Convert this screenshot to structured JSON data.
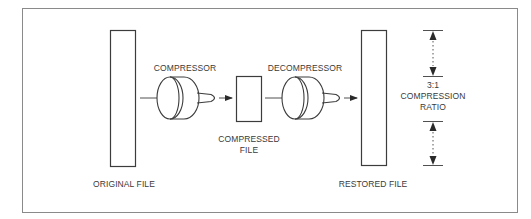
{
  "diagram": {
    "colors": {
      "stroke": "#3c3c3c",
      "frame": "#8a8a8a",
      "text": "#3a3a3a",
      "background": "#ffffff"
    },
    "nodes": {
      "original_file": {
        "label": "ORIGINAL FILE"
      },
      "compressor": {
        "label": "COMPRESSOR"
      },
      "compressed_file": {
        "label": "COMPRESSED\nFILE"
      },
      "decompressor": {
        "label": "DECOMPRESSOR"
      },
      "restored_file": {
        "label": "RESTORED FILE"
      }
    },
    "ratio": {
      "value": "3:1",
      "label": "COMPRESSION\nRATIO"
    },
    "flow": [
      {
        "from": "original_file",
        "to": "compressor"
      },
      {
        "from": "compressor",
        "to": "compressed_file"
      },
      {
        "from": "compressed_file",
        "to": "decompressor"
      },
      {
        "from": "decompressor",
        "to": "restored_file"
      }
    ]
  }
}
